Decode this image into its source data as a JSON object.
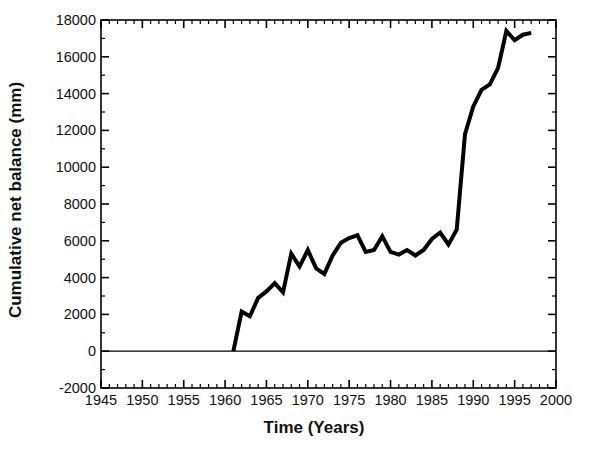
{
  "chart_data": {
    "type": "line",
    "title": "",
    "xlabel": "Time (Years)",
    "ylabel": "Cumulative net balance (mm)",
    "xlim": [
      1945,
      2000
    ],
    "ylim": [
      -2000,
      18000
    ],
    "grid": false,
    "legend": null,
    "x_major_ticks": [
      1945,
      1950,
      1955,
      1960,
      1965,
      1970,
      1975,
      1980,
      1985,
      1990,
      1995,
      2000
    ],
    "x_tick_labels": [
      "1945",
      "1950",
      "1955",
      "1960",
      "1965",
      "1970",
      "1975",
      "1980",
      "1985",
      "1990",
      "1995",
      "2000"
    ],
    "x_minor_tick_interval": 1,
    "y_major_ticks": [
      -2000,
      0,
      2000,
      4000,
      6000,
      8000,
      10000,
      12000,
      14000,
      16000,
      18000
    ],
    "y_tick_labels": [
      "-2000",
      "0",
      "2000",
      "4000",
      "6000",
      "8000",
      "10000",
      "12000",
      "14000",
      "16000",
      "18000"
    ],
    "y_minor_tick_interval": 1000,
    "series": [
      {
        "name": "Cumulative net balance",
        "color": "#000000",
        "line_width": 4,
        "x": [
          1961,
          1962,
          1963,
          1964,
          1965,
          1966,
          1967,
          1968,
          1969,
          1970,
          1971,
          1972,
          1973,
          1974,
          1975,
          1976,
          1977,
          1978,
          1979,
          1980,
          1981,
          1982,
          1983,
          1984,
          1985,
          1986,
          1987,
          1988,
          1989,
          1990,
          1991,
          1992,
          1993,
          1994,
          1995,
          1996,
          1997
        ],
        "y": [
          0,
          2150,
          1900,
          2900,
          3250,
          3700,
          3200,
          5300,
          4600,
          5500,
          4500,
          4200,
          5200,
          5900,
          6150,
          6300,
          5400,
          5500,
          6250,
          5400,
          5250,
          5500,
          5200,
          5500,
          6100,
          6450,
          5800,
          6600,
          11800,
          13300,
          14200,
          14500,
          15400,
          17400,
          16900,
          17200,
          17300
        ]
      }
    ]
  },
  "axes": {
    "frame_color": "#000000",
    "background": "#ffffff"
  }
}
